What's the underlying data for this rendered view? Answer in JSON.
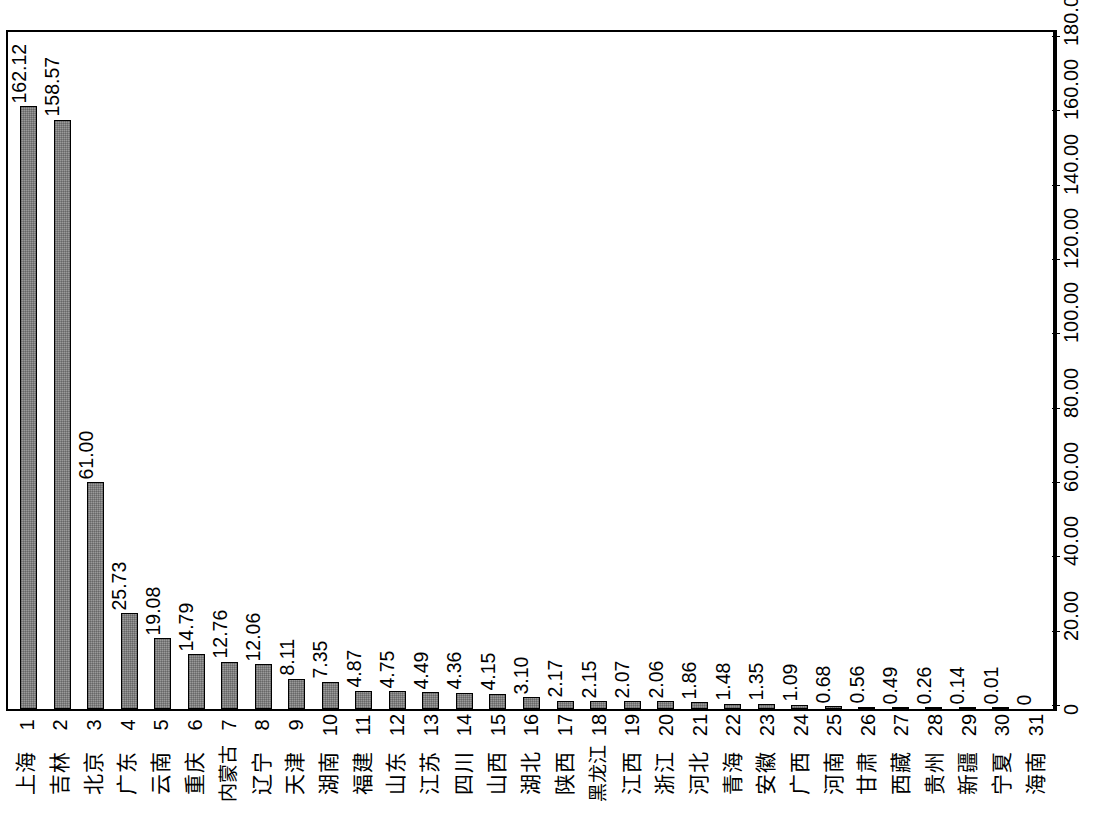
{
  "chart_data": {
    "type": "bar",
    "title": "",
    "subtitle": "",
    "xlabel": "",
    "ylabel": "",
    "orientation": "vertical-bars-rotated-90ccw",
    "grid": false,
    "legend": null,
    "value_axis": {
      "min": 0,
      "max": 180,
      "ticks": [
        0,
        20,
        40,
        60,
        80,
        100,
        120,
        140,
        160,
        180
      ],
      "tick_labels": [
        "0",
        "20.00",
        "40.00",
        "60.00",
        "80.00",
        "100.00",
        "120.00",
        "140.00",
        "160.00",
        "180.00"
      ],
      "position": "right"
    },
    "category_axis": {
      "rank_labels": [
        "1",
        "2",
        "3",
        "4",
        "5",
        "6",
        "7",
        "8",
        "9",
        "10",
        "11",
        "12",
        "13",
        "14",
        "15",
        "16",
        "17",
        "18",
        "19",
        "20",
        "21",
        "22",
        "23",
        "24",
        "25",
        "26",
        "27",
        "28",
        "29",
        "30",
        "31"
      ]
    },
    "categories": [
      "上海",
      "吉林",
      "北京",
      "广东",
      "云南",
      "重庆",
      "内蒙古",
      "辽宁",
      "天津",
      "湖南",
      "福建",
      "山东",
      "江苏",
      "四川",
      "山西",
      "湖北",
      "陕西",
      "黑龙江",
      "江西",
      "浙江",
      "河北",
      "青海",
      "安徽",
      "广西",
      "河南",
      "甘肃",
      "西藏",
      "贵州",
      "新疆",
      "宁夏",
      "海南"
    ],
    "values": [
      162.12,
      158.57,
      61.0,
      25.73,
      19.08,
      14.79,
      12.76,
      12.06,
      8.11,
      7.35,
      4.87,
      4.75,
      4.49,
      4.36,
      4.15,
      3.1,
      2.17,
      2.15,
      2.07,
      2.06,
      1.86,
      1.48,
      1.35,
      1.09,
      0.68,
      0.56,
      0.49,
      0.26,
      0.14,
      0.01,
      0
    ],
    "data_labels": [
      "162.12",
      "158.57",
      "61.00",
      "25.73",
      "19.08",
      "14.79",
      "12.76",
      "12.06",
      "8.11",
      "7.35",
      "4.87",
      "4.75",
      "4.49",
      "4.36",
      "4.15",
      "3.10",
      "2.17",
      "2.15",
      "2.07",
      "2.06",
      "1.86",
      "1.48",
      "1.35",
      "1.09",
      "0.68",
      "0.56",
      "0.49",
      "0.26",
      "0.14",
      "0.01",
      "0"
    ],
    "bar_color": "#9a9a9a",
    "bar_border_color": "#000000",
    "plot_border_color": "#000000",
    "background_color": "#ffffff"
  }
}
